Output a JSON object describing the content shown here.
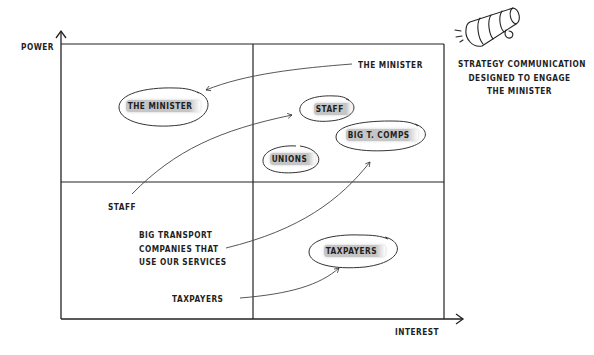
{
  "axes": {
    "y_label": "POWER",
    "x_label": "INTEREST"
  },
  "grid": {
    "left": 61,
    "top": 44,
    "right": 444,
    "bottom": 319,
    "mid_x": 253,
    "mid_y": 182,
    "line_color": "#2a2a2a"
  },
  "stakeholders": [
    {
      "id": "minister",
      "label": "THE MINISTER",
      "quadrant": "high-power-low-interest"
    },
    {
      "id": "staff",
      "label": "STAFF",
      "quadrant": "high-power-high-interest"
    },
    {
      "id": "big-t-comps",
      "label": "BIG T. COMPS",
      "quadrant": "high-power-high-interest"
    },
    {
      "id": "unions",
      "label": "UNIONS",
      "quadrant": "high-power-high-interest"
    },
    {
      "id": "taxpayers",
      "label": "TAXPAYERS",
      "quadrant": "low-power-high-interest"
    }
  ],
  "annotations": {
    "minister_source": "THE MINISTER",
    "staff_source": "STAFF",
    "big_transport_lines": [
      "BIG TRANSPORT",
      "COMPANIES THAT",
      "USE OUR SERVICES"
    ],
    "taxpayers_source": "TAXPAYERS"
  },
  "callout": {
    "icon": "megaphone-icon",
    "lines": [
      "STRATEGY COMMUNICATION",
      "DESIGNED TO ENGAGE",
      "THE MINISTER"
    ]
  },
  "colors": {
    "ink": "#1e1e1e",
    "highlight": "#969696",
    "background": "#ffffff"
  }
}
